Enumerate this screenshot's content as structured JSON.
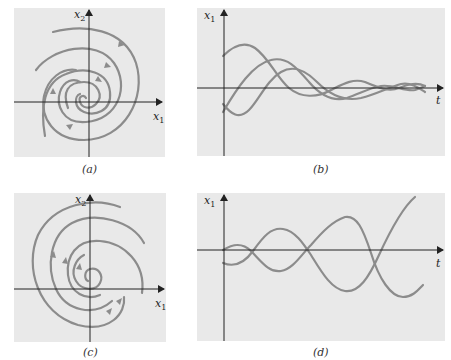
{
  "figure": {
    "colors": {
      "panel_bg": "#e9e9e9",
      "curve": "#8c8c8c",
      "axis": "#222222"
    },
    "panels": [
      {
        "id": "a",
        "caption": "(a)",
        "type": "phase-portrait",
        "x_axis_label": "x",
        "x_axis_sub": "1",
        "y_axis_label": "x",
        "y_axis_sub": "2",
        "description": "Stable spiral: trajectories spiral inward toward origin, clockwise"
      },
      {
        "id": "b",
        "caption": "(b)",
        "type": "time-series",
        "x_axis_label": "t",
        "y_axis_label": "x",
        "y_axis_sub": "1",
        "description": "Damped oscillations decaying to zero"
      },
      {
        "id": "c",
        "caption": "(c)",
        "type": "phase-portrait",
        "x_axis_label": "x",
        "x_axis_sub": "1",
        "y_axis_label": "x",
        "y_axis_sub": "2",
        "description": "Unstable spiral: trajectories spiral outward from origin, counterclockwise"
      },
      {
        "id": "d",
        "caption": "(d)",
        "type": "time-series",
        "x_axis_label": "t",
        "y_axis_label": "x",
        "y_axis_sub": "1",
        "description": "Growing oscillations diverging from zero"
      }
    ]
  }
}
